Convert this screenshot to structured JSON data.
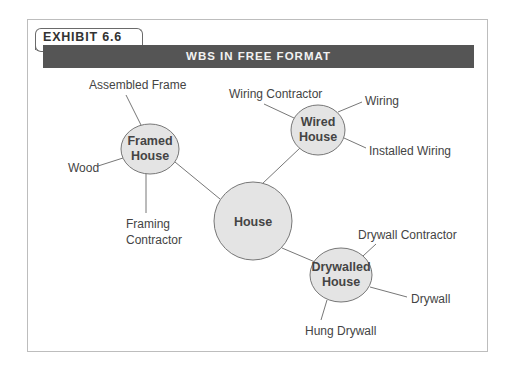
{
  "exhibit": {
    "label": "EXHIBIT 6.6",
    "title": "WBS IN FREE FORMAT"
  },
  "colors": {
    "header_bar": "#555555",
    "header_text": "#f2f2f2",
    "node_fill": "#e4e4e4",
    "node_stroke": "#777777",
    "line": "#777777",
    "text": "#444444",
    "frame_border": "#bdbdbd"
  },
  "diagram": {
    "root": {
      "label": "House"
    },
    "nodes": [
      {
        "label_line1": "Framed",
        "label_line2": "House",
        "children": [
          "Assembled Frame",
          "Wood",
          "Framing Contractor"
        ]
      },
      {
        "label_line1": "Wired",
        "label_line2": "House",
        "children": [
          "Wiring Contractor",
          "Wiring",
          "Installed Wiring"
        ]
      },
      {
        "label_line1": "Drywalled",
        "label_line2": "House",
        "children": [
          "Drywall Contractor",
          "Drywall",
          "Hung Drywall"
        ]
      }
    ],
    "leaves": {
      "assembled_frame": "Assembled Frame",
      "wood": "Wood",
      "framing_contractor_line1": "Framing",
      "framing_contractor_line2": "Contractor",
      "wiring_contractor": "Wiring Contractor",
      "wiring": "Wiring",
      "installed_wiring": "Installed Wiring",
      "drywall_contractor": "Drywall Contractor",
      "drywall": "Drywall",
      "hung_drywall": "Hung Drywall"
    }
  }
}
